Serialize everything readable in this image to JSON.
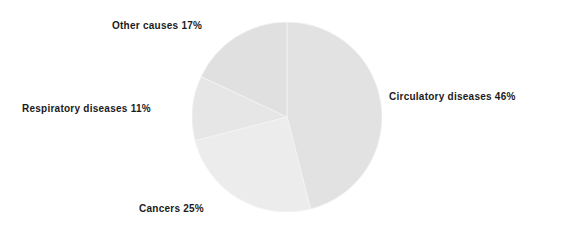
{
  "chart_data": {
    "type": "pie",
    "title": "",
    "subtitle": "",
    "xlabel": "",
    "ylabel": "",
    "legend_position": "none",
    "grid": false,
    "labels_outside": true,
    "start_angle_deg": 0,
    "direction": "clockwise",
    "categories": [
      "Circulatory diseases",
      "Cancers",
      "Respiratory diseases",
      "Other causes"
    ],
    "values": [
      46,
      25,
      11,
      17
    ],
    "unit": "%",
    "slices": [
      {
        "name": "Circulatory diseases",
        "value": 46,
        "label": "Circulatory diseases 46%",
        "color": "#e2e2e2",
        "start_deg": 0,
        "end_deg": 165.6
      },
      {
        "name": "Cancers",
        "value": 25,
        "label": "Cancers 25%",
        "color": "#ececec",
        "start_deg": 165.6,
        "end_deg": 255.6
      },
      {
        "name": "Respiratory diseases",
        "value": 11,
        "label": "Respiratory diseases 11%",
        "color": "#e6e6e6",
        "start_deg": 255.6,
        "end_deg": 295.2
      },
      {
        "name": "Other causes",
        "value": 17,
        "label": "Other causes 17%",
        "color": "#e0e0e0",
        "start_deg": 295.2,
        "end_deg": 360
      }
    ]
  },
  "labels": {
    "other_causes": "Other causes 17%",
    "respiratory_diseases": "Respiratory diseases 11%",
    "circulatory_diseases": "Circulatory diseases 46%",
    "cancers": "Cancers 25%"
  },
  "colors": {
    "background": "#ffffff",
    "text": "#1b1b1b",
    "slice_circulatory": "#e2e2e2",
    "slice_cancers": "#ececec",
    "slice_respiratory": "#e6e6e6",
    "slice_other": "#e0e0e0",
    "slice_divider": "#f4f4f4"
  }
}
